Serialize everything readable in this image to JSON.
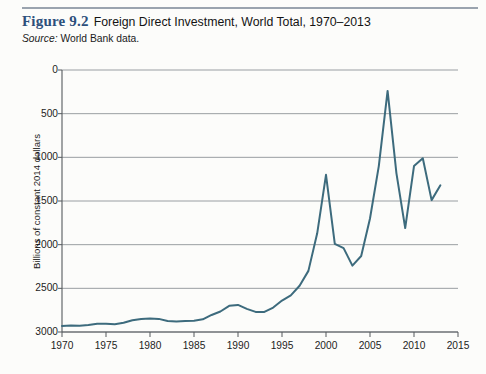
{
  "figure": {
    "label": "Figure 9.2",
    "title": "Foreign Direct Investment, World Total, 1970–2013",
    "source_prefix": "Source:",
    "source_text": "World Bank data.",
    "label_color": "#2d4f7c",
    "rule_color": "#9aa3ae"
  },
  "chart_data": {
    "type": "line",
    "title": "Foreign Direct Investment, World Total, 1970–2013",
    "xlabel": "",
    "ylabel": "Billions of constant 2014 dollars",
    "xlim": [
      1970,
      2015
    ],
    "ylim": [
      0,
      3000
    ],
    "xticks": [
      1970,
      1975,
      1980,
      1985,
      1990,
      1995,
      2000,
      2005,
      2010,
      2015
    ],
    "yticks": [
      0,
      500,
      1000,
      1500,
      2000,
      2500,
      3000
    ],
    "grid": "horizontal",
    "legend": "none",
    "line_color": "#3d6b7d",
    "line_width": 2,
    "series": [
      {
        "name": "Foreign Direct Investment, World Total",
        "x": [
          1970,
          1971,
          1972,
          1973,
          1974,
          1975,
          1976,
          1977,
          1978,
          1979,
          1980,
          1981,
          1982,
          1983,
          1984,
          1985,
          1986,
          1987,
          1988,
          1989,
          1990,
          1991,
          1992,
          1993,
          1994,
          1995,
          1996,
          1997,
          1998,
          1999,
          2000,
          2001,
          2002,
          2003,
          2004,
          2005,
          2006,
          2007,
          2008,
          2009,
          2010,
          2011,
          2012,
          2013
        ],
        "values": [
          70,
          75,
          72,
          80,
          95,
          95,
          90,
          105,
          135,
          150,
          155,
          150,
          125,
          120,
          125,
          130,
          145,
          195,
          235,
          300,
          310,
          265,
          230,
          230,
          280,
          360,
          420,
          530,
          700,
          1130,
          1800,
          1010,
          960,
          760,
          870,
          1300,
          1900,
          2760,
          1820,
          1190,
          1900,
          1990,
          1510,
          1680
        ]
      }
    ]
  },
  "axes": {
    "y_tick_labels": [
      "3000",
      "2500",
      "2000",
      "1500",
      "1000",
      "500",
      "0"
    ],
    "x_tick_labels": [
      "1970",
      "1975",
      "1980",
      "1985",
      "1990",
      "1995",
      "2000",
      "2005",
      "2010",
      "2015"
    ]
  }
}
